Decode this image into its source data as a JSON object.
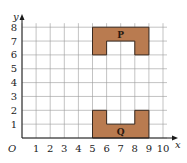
{
  "figure": {
    "type": "coordinate-grid",
    "origin_label": "O",
    "x_axis": {
      "label": "x",
      "min": 0,
      "max": 10,
      "ticks": [
        "1",
        "2",
        "3",
        "4",
        "5",
        "6",
        "7",
        "8",
        "9",
        "10"
      ]
    },
    "y_axis": {
      "label": "y",
      "min": 0,
      "max": 8,
      "ticks": [
        "1",
        "2",
        "3",
        "4",
        "5",
        "6",
        "7",
        "8"
      ]
    },
    "fill_color": "#B97B50",
    "shapes": [
      {
        "name": "P",
        "label": "P",
        "vertices": [
          [
            5,
            8
          ],
          [
            9,
            8
          ],
          [
            9,
            6
          ],
          [
            8,
            6
          ],
          [
            8,
            7
          ],
          [
            6,
            7
          ],
          [
            6,
            6
          ],
          [
            5,
            6
          ]
        ],
        "label_position": [
          7,
          7.5
        ]
      },
      {
        "name": "Q",
        "label": "Q",
        "vertices": [
          [
            5,
            0
          ],
          [
            9,
            0
          ],
          [
            9,
            2
          ],
          [
            8,
            2
          ],
          [
            8,
            1
          ],
          [
            6,
            1
          ],
          [
            6,
            2
          ],
          [
            5,
            2
          ]
        ],
        "label_position": [
          7,
          0.5
        ]
      }
    ]
  }
}
